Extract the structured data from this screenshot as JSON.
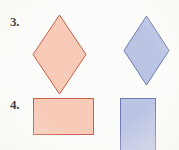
{
  "page": {
    "background_color": "#fcfcfa",
    "width": 179,
    "height": 150
  },
  "palette": {
    "salmon_fill": "#f7cbb8",
    "salmon_stroke": "#c8604a",
    "blue_fill": "#bcc4e4",
    "blue_stroke": "#6a7ab4",
    "label_color": "#1c1a18"
  },
  "problems": [
    {
      "number": "3.",
      "label_x": 10,
      "label_y": 15,
      "label_size": 13,
      "shapes": [
        {
          "name": "salmon-rhombus",
          "kind": "rhombus",
          "color_name": "salmon",
          "x": 33,
          "y": 15,
          "width": 53,
          "height": 79
        },
        {
          "name": "blue-rhombus",
          "kind": "rhombus",
          "color_name": "blue",
          "x": 124,
          "y": 16,
          "width": 45,
          "height": 69
        }
      ]
    },
    {
      "number": "4.",
      "label_x": 10,
      "label_y": 98,
      "label_size": 13,
      "shapes": [
        {
          "name": "salmon-rectangle",
          "kind": "rectangle",
          "color_name": "salmon",
          "x": 33,
          "y": 98,
          "width": 61,
          "height": 37
        },
        {
          "name": "blue-rectangle",
          "kind": "rectangle",
          "color_name": "blue",
          "x": 120,
          "y": 98,
          "width": 36,
          "height": 54
        }
      ]
    }
  ]
}
